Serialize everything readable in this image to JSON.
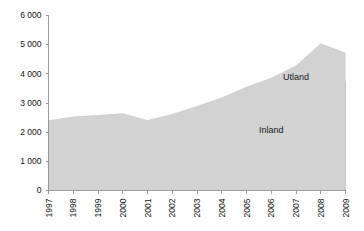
{
  "chart_data": {
    "type": "area",
    "stacked": true,
    "title": "",
    "subtitle": "",
    "xlabel": "",
    "ylabel": "",
    "categories": [
      "1997",
      "1998",
      "1999",
      "2000",
      "2001",
      "2002",
      "2003",
      "2004",
      "2005",
      "2006",
      "2007",
      "2008",
      "2009"
    ],
    "series": [
      {
        "name": "Inland",
        "color": "#808080",
        "values": [
          2080,
          2210,
          2270,
          2350,
          2150,
          2300,
          2470,
          2660,
          2950,
          3170,
          3480,
          3850,
          3760
        ]
      },
      {
        "name": "Utland",
        "color": "#d2d2d2",
        "values": [
          330,
          330,
          320,
          300,
          270,
          320,
          430,
          530,
          610,
          700,
          810,
          1200,
          960
        ]
      }
    ],
    "totals": [
      2410,
      2540,
      2590,
      2650,
      2420,
      2620,
      2900,
      3190,
      3560,
      3870,
      4290,
      5050,
      4720
    ],
    "ylim": [
      0,
      6000
    ],
    "ytick_values": [
      0,
      1000,
      2000,
      3000,
      4000,
      5000,
      6000
    ],
    "ytick_labels": [
      "0",
      "1 000",
      "2 000",
      "3 000",
      "4 000",
      "5 000",
      "6 000"
    ],
    "grid": false,
    "legend_position": "inline",
    "xtick_rotation": -90,
    "annotations": [
      {
        "text": "Utland",
        "series": "Utland",
        "x_category": "2007"
      },
      {
        "text": "Inland",
        "series": "Inland",
        "x_category": "2006"
      }
    ]
  },
  "axis": {
    "line_color": "#9a9a9a"
  },
  "plot": {
    "background": "#ffffff"
  }
}
